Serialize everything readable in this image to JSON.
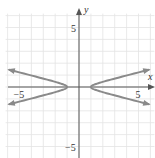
{
  "chart_data": {
    "type": "line",
    "title": "",
    "xlabel": "x",
    "ylabel": "y",
    "xlim": [
      -6,
      6
    ],
    "ylim": [
      -6,
      6
    ],
    "grid": true,
    "grid_step": 1,
    "tick_labels": {
      "x": [
        {
          "value": -5,
          "label": "−5"
        },
        {
          "value": 5,
          "label": "5"
        }
      ],
      "y": [
        {
          "value": 5,
          "label": "5"
        },
        {
          "value": -5,
          "label": "−5"
        }
      ]
    },
    "series": [
      {
        "name": "hyperbola",
        "equation": "x^2 - 16y^2 = 1",
        "description": "Horizontal hyperbola, vertices at (±1, 0), asymptotes y = ±x/4, arrows at both ends of each branch",
        "vertices": [
          [
            -1,
            0
          ],
          [
            1,
            0
          ]
        ],
        "branch_extent_x": 5.9,
        "color": "#8a8a8a"
      }
    ]
  },
  "colors": {
    "grid": "#e3e3e3",
    "axis": "#555555",
    "curve": "#8a8a8a"
  }
}
